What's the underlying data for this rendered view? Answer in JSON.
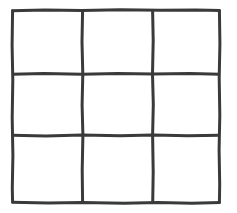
{
  "figure": {
    "name": "hand-drawn-3x3-grid",
    "kind": "line-drawing",
    "title": "",
    "caption": "",
    "width": 237,
    "height": 213,
    "background_color": "#ffffff",
    "ink_color": "#3a3a3a",
    "ink_color_light": "#555555",
    "stroke_width": 3,
    "style": "hand-drawn scanned pen line, slightly wobbly, unequal cell sizes"
  },
  "grid": {
    "rows": 3,
    "columns": 3,
    "cell_count": 9,
    "bounds": {
      "left": 11,
      "top": 9,
      "right": 221,
      "bottom": 204
    },
    "vertical_lines_x": [
      12.5,
      82.5,
      153.0,
      219.5
    ],
    "horizontal_lines_y": [
      10.5,
      74.0,
      135.5,
      202.5
    ],
    "column_widths": [
      70,
      70.5,
      66.5
    ],
    "row_heights": [
      63.5,
      61.5,
      67
    ],
    "cells": [
      {
        "name": "cell-r1-c1",
        "row": 1,
        "col": 1,
        "label": ""
      },
      {
        "name": "cell-r1-c2",
        "row": 1,
        "col": 2,
        "label": ""
      },
      {
        "name": "cell-r1-c3",
        "row": 1,
        "col": 3,
        "label": ""
      },
      {
        "name": "cell-r2-c1",
        "row": 2,
        "col": 1,
        "label": ""
      },
      {
        "name": "cell-r2-c2",
        "row": 2,
        "col": 2,
        "label": ""
      },
      {
        "name": "cell-r2-c3",
        "row": 2,
        "col": 3,
        "label": ""
      },
      {
        "name": "cell-r3-c1",
        "row": 3,
        "col": 1,
        "label": ""
      },
      {
        "name": "cell-r3-c2",
        "row": 3,
        "col": 2,
        "label": ""
      },
      {
        "name": "cell-r3-c3",
        "row": 3,
        "col": 3,
        "label": ""
      }
    ],
    "strokes": {
      "border_top": "M 11.5 10.8 L 45 10.0 L 82 10.4 L 120 9.8 L 160 10.3 L 196 9.9 L 220.5 10.6",
      "border_bottom": "M 11.8 202.2 L 48 203.1 L 82 202.4 L 124 203.3 L 158 202.6 L 192 203.2 L 220.5 202.4",
      "border_left": "M 12.6 9.8 L 12.1 45 L 12.8 80 L 12.2 118 L 12.9 155 L 12.3 188 L 12.6 203.2",
      "border_right": "M 219.4 9.8 L 219.9 44 L 219.2 78 L 219.8 115 L 219.1 150 L 219.7 184 L 219.4 203.2",
      "inner_h_1": "M 12.0 74.3 L 44 73.6 L 82 74.2 L 118 73.5 L 153 74.1 L 190 73.6 L 220.0 74.3",
      "inner_h_2": "M 12.0 135.2 L 46 135.9 L 82 135.1 L 120 135.8 L 153 135.0 L 188 135.7 L 220.0 135.2",
      "inner_v_1": "M 82.6 10.2 L 82.0 42 L 82.8 74 L 82.1 105 L 82.9 135 L 82.2 170 L 82.6 202.6",
      "inner_v_2": "M 152.6 10.2 L 153.2 40 L 152.5 74 L 153.3 104 L 152.6 135 L 153.2 172 L 152.7 202.6"
    }
  }
}
